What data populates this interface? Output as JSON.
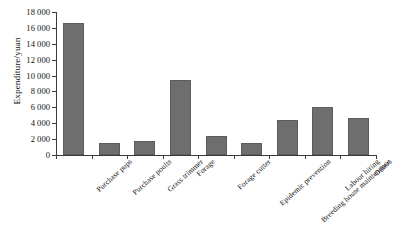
{
  "chart_data": {
    "type": "bar",
    "title": "",
    "xlabel": "",
    "ylabel": "Expenditure/yuan",
    "ylim": [
      0,
      18000
    ],
    "ytick_step": 2000,
    "grid": false,
    "legend": null,
    "bar_color": "#6e6e6e",
    "axis_color": "#3a3a3a",
    "categories": [
      "Purchase pups",
      "Purchase poults",
      "Grass trimmer",
      "Forage",
      "Forage cutter",
      "Epidemic prevention",
      "Breeding house maintenance",
      "Labour hiring",
      "Others"
    ],
    "values": [
      16600,
      1550,
      1800,
      9500,
      2450,
      1550,
      4400,
      6000,
      4650
    ],
    "ytick_labels": [
      "0",
      "2 000",
      "4 000",
      "6 000",
      "8 000",
      "10 000",
      "12 000",
      "14 000",
      "16 000",
      "18 000"
    ],
    "ytick_values": [
      0,
      2000,
      4000,
      6000,
      8000,
      10000,
      12000,
      14000,
      16000,
      18000
    ]
  }
}
